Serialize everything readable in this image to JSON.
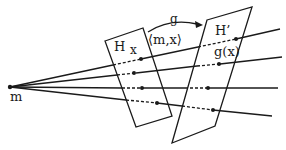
{
  "diagram": {
    "labels": {
      "apex": "m",
      "plane_h": "H",
      "point_x": "x",
      "map": "g",
      "span": "⟨m,x⟩",
      "plane_h_prime": "H’",
      "point_gx": "g(x)"
    },
    "colors": {
      "stroke": "#1a1a1a",
      "background": "#ffffff"
    }
  }
}
